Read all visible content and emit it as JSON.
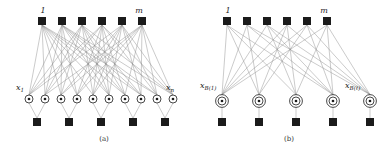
{
  "figure": {
    "kind": "factor-graph-diagram",
    "width": 388,
    "height": 149,
    "background": "#ffffff",
    "ink": "#1b1b1b",
    "edge_color": "#8a8a8a",
    "panels": [
      {
        "id": "a",
        "caption": "(a)",
        "caption_x": 104,
        "caption_y": 141,
        "top_label_left": "1",
        "top_label_right": "m",
        "top_label_left_x": 43,
        "top_label_left_y": 13,
        "top_label_right_x": 139,
        "top_label_right_y": 13,
        "var_label_left_base": "x",
        "var_label_left_sub": "1",
        "var_label_right_base": "x",
        "var_label_right_sub": "n",
        "var_label_left_x": 16,
        "var_label_left_y": 90,
        "var_label_right_x": 166,
        "var_label_right_y": 90,
        "top_nodes_y": 21,
        "top_nodes_x": [
          42,
          62,
          82,
          102,
          122,
          142
        ],
        "mid_nodes_y": 99,
        "mid_nodes_x": [
          29,
          45,
          61,
          77,
          93,
          109,
          125,
          141,
          157,
          173
        ],
        "bottom_nodes_y": 122,
        "bottom_nodes_x": [
          37,
          69,
          101,
          133,
          165
        ],
        "node_square_size": 8,
        "node_circle_r": 4,
        "mid_node_style": "single-circle-with-inner-dot",
        "bottom_groups": [
          [
            0,
            1
          ],
          [
            2,
            3
          ],
          [
            4,
            5
          ],
          [
            6,
            7
          ],
          [
            8,
            9
          ]
        ],
        "edges_top_to_mid": [
          [
            0,
            0
          ],
          [
            0,
            1
          ],
          [
            0,
            2
          ],
          [
            0,
            3
          ],
          [
            0,
            4
          ],
          [
            0,
            5
          ],
          [
            0,
            6
          ],
          [
            0,
            7
          ],
          [
            0,
            8
          ],
          [
            1,
            0
          ],
          [
            1,
            1
          ],
          [
            1,
            2
          ],
          [
            1,
            3
          ],
          [
            1,
            5
          ],
          [
            1,
            6
          ],
          [
            1,
            7
          ],
          [
            1,
            8
          ],
          [
            1,
            9
          ],
          [
            2,
            0
          ],
          [
            2,
            1
          ],
          [
            2,
            2
          ],
          [
            2,
            4
          ],
          [
            2,
            5
          ],
          [
            2,
            6
          ],
          [
            2,
            7
          ],
          [
            2,
            9
          ],
          [
            3,
            0
          ],
          [
            3,
            1
          ],
          [
            3,
            3
          ],
          [
            3,
            4
          ],
          [
            3,
            5
          ],
          [
            3,
            6
          ],
          [
            3,
            8
          ],
          [
            3,
            9
          ],
          [
            4,
            0
          ],
          [
            4,
            2
          ],
          [
            4,
            3
          ],
          [
            4,
            4
          ],
          [
            4,
            5
          ],
          [
            4,
            7
          ],
          [
            4,
            8
          ],
          [
            4,
            9
          ],
          [
            5,
            1
          ],
          [
            5,
            2
          ],
          [
            5,
            3
          ],
          [
            5,
            4
          ],
          [
            5,
            6
          ],
          [
            5,
            7
          ],
          [
            5,
            8
          ],
          [
            5,
            9
          ]
        ]
      },
      {
        "id": "b",
        "caption": "(b)",
        "caption_x": 289,
        "caption_y": 141,
        "top_label_left": "1",
        "top_label_right": "m",
        "top_label_left_x": 228,
        "top_label_left_y": 13,
        "top_label_right_x": 324,
        "top_label_right_y": 13,
        "var_label_left_base": "x",
        "var_label_left_sub": "B(1)",
        "var_label_right_base": "x",
        "var_label_right_sub": "B(ℓ)",
        "var_label_left_x": 200,
        "var_label_left_y": 88,
        "var_label_right_x": 345,
        "var_label_right_y": 88,
        "top_nodes_y": 21,
        "top_nodes_x": [
          227,
          247,
          267,
          287,
          307,
          327
        ],
        "mid_nodes_y": 101,
        "mid_nodes_x": [
          222,
          259,
          296,
          333,
          370
        ],
        "bottom_nodes_y": 122,
        "bottom_nodes_x": [
          222,
          259,
          296,
          333,
          370
        ],
        "node_square_size": 8,
        "node_circle_r": 4,
        "node_circle_outer_r": 6.4,
        "mid_node_style": "double-circle-with-inner-dot",
        "edges_top_to_mid": [
          [
            0,
            0
          ],
          [
            0,
            1
          ],
          [
            0,
            2
          ],
          [
            0,
            3
          ],
          [
            1,
            0
          ],
          [
            1,
            1
          ],
          [
            1,
            3
          ],
          [
            1,
            4
          ],
          [
            2,
            0
          ],
          [
            2,
            2
          ],
          [
            2,
            3
          ],
          [
            2,
            4
          ],
          [
            3,
            0
          ],
          [
            3,
            1
          ],
          [
            3,
            2
          ],
          [
            3,
            4
          ],
          [
            4,
            0
          ],
          [
            4,
            1
          ],
          [
            4,
            3
          ],
          [
            4,
            4
          ],
          [
            5,
            0
          ],
          [
            5,
            2
          ],
          [
            5,
            3
          ],
          [
            5,
            4
          ]
        ]
      }
    ]
  }
}
